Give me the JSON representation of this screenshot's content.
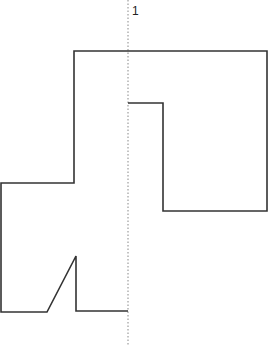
{
  "diagram": {
    "axis_label": "1",
    "axis": {
      "x": 128,
      "y1": 0,
      "y2": 345,
      "style": "dotted",
      "color": "#888888"
    },
    "outline": {
      "color": "#333333",
      "stroke_width": 1.6,
      "points": "128,311 76,311 76,256 47,312 1,312 1,183 74,183 74,51 267,51 267,211 163,211 163,103 128,103"
    }
  }
}
